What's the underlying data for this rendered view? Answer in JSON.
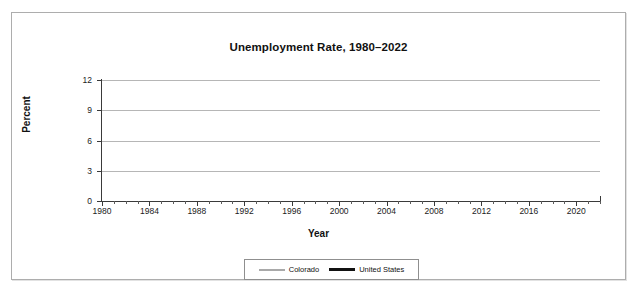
{
  "corner_note": "",
  "chart_data": {
    "type": "line",
    "title": "Unemployment Rate, 1980–2022",
    "xlabel": "Year",
    "ylabel": "Percent",
    "ylim": [
      0,
      12
    ],
    "yticks": [
      0,
      3,
      6,
      9,
      12
    ],
    "xlim": [
      1980,
      2022
    ],
    "xticks": [
      1980,
      1984,
      1988,
      1992,
      1996,
      2000,
      2004,
      2008,
      2012,
      2016,
      2020
    ],
    "xtick_labels": [
      "1980",
      "1984",
      "1988",
      "1992",
      "1996",
      "2000",
      "2004",
      "2008",
      "2012",
      "2016",
      "2020"
    ],
    "ytick_labels": [
      "0",
      "3",
      "6",
      "9",
      "12"
    ],
    "grid": "horizontal",
    "legend_position": "bottom",
    "x": [
      1980,
      1981,
      1982,
      1983,
      1984,
      1985,
      1986,
      1987,
      1988,
      1989,
      1990,
      1991,
      1992,
      1993,
      1994,
      1995,
      1996,
      1997,
      1998,
      1999,
      2000,
      2001,
      2002,
      2003,
      2004,
      2005,
      2006,
      2007,
      2008,
      2009,
      2010,
      2011,
      2012,
      2013,
      2014,
      2015,
      2016,
      2017,
      2018,
      2019,
      2020,
      2021,
      2022
    ],
    "series": [
      {
        "name": "Colorado",
        "color": "#a9a9a9",
        "values": [
          5.9,
          5.4,
          7.7,
          6.7,
          5.4,
          5.9,
          7.4,
          7.6,
          6.4,
          5.5,
          4.9,
          5.0,
          6.1,
          5.2,
          4.2,
          4.2,
          4.2,
          3.7,
          3.8,
          3.0,
          2.7,
          3.7,
          5.6,
          6.0,
          5.5,
          5.0,
          4.3,
          3.9,
          4.8,
          8.3,
          9.0,
          8.6,
          7.9,
          6.9,
          5.0,
          3.9,
          3.2,
          3.0,
          3.3,
          2.8,
          6.9,
          5.4,
          3.3
        ]
      },
      {
        "name": "United States",
        "color": "#111111",
        "values": [
          7.1,
          7.6,
          9.7,
          9.6,
          7.5,
          7.2,
          7.0,
          6.2,
          5.5,
          5.3,
          5.6,
          6.8,
          7.5,
          6.9,
          6.1,
          5.6,
          5.4,
          4.9,
          4.5,
          4.2,
          4.0,
          4.7,
          5.8,
          6.0,
          5.5,
          5.1,
          4.6,
          4.6,
          5.8,
          9.3,
          11.0,
          10.3,
          8.9,
          8.1,
          6.9,
          6.0,
          5.3,
          4.6,
          4.1,
          3.7,
          8.1,
          5.3,
          3.6
        ]
      }
    ]
  },
  "legend": {
    "items": [
      {
        "label": "Colorado"
      },
      {
        "label": "United States"
      }
    ]
  }
}
